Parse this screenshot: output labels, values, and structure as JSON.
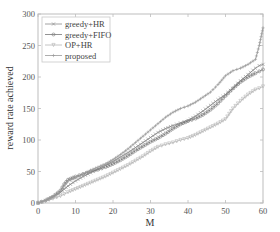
{
  "chart_data": {
    "type": "line",
    "title": "",
    "xlabel": "M",
    "ylabel": "reward rate achieved",
    "xlim": [
      0,
      60
    ],
    "ylim": [
      0,
      300
    ],
    "xticks": [
      0,
      10,
      20,
      30,
      40,
      50,
      60
    ],
    "yticks": [
      0,
      50,
      100,
      150,
      200,
      250,
      300
    ],
    "grid": false,
    "legend_position": "upper left",
    "x": [
      0,
      2,
      4,
      6,
      7,
      8,
      10,
      12,
      14,
      16,
      18,
      20,
      22,
      24,
      26,
      28,
      30,
      32,
      34,
      36,
      38,
      40,
      42,
      44,
      46,
      48,
      50,
      52,
      54,
      56,
      58,
      59,
      60
    ],
    "series": [
      {
        "name": "greedy+HR",
        "marker": "x",
        "color": "#8a8a8a",
        "values": [
          0,
          4,
          10,
          17,
          22,
          27,
          35,
          42,
          48,
          54,
          60,
          66,
          73,
          80,
          88,
          96,
          104,
          112,
          118,
          123,
          127,
          131,
          138,
          146,
          155,
          164,
          172,
          182,
          194,
          204,
          214,
          218,
          220
        ]
      },
      {
        "name": "greedy+FIFO",
        "marker": "o",
        "color": "#777777",
        "values": [
          0,
          4,
          10,
          20,
          30,
          37,
          42,
          46,
          50,
          53,
          57,
          62,
          68,
          75,
          83,
          90,
          97,
          103,
          110,
          118,
          125,
          130,
          134,
          140,
          148,
          158,
          170,
          182,
          192,
          200,
          206,
          209,
          212
        ]
      },
      {
        "name": "OP+HR",
        "marker": "v",
        "color": "#b5b5b5",
        "values": [
          0,
          3,
          7,
          11,
          14,
          17,
          22,
          27,
          32,
          37,
          42,
          48,
          54,
          60,
          67,
          74,
          82,
          89,
          93,
          96,
          100,
          103,
          108,
          114,
          120,
          126,
          133,
          150,
          162,
          172,
          180,
          182,
          185
        ]
      },
      {
        "name": "proposed",
        "marker": "+",
        "color": "#999999",
        "values": [
          0,
          4,
          10,
          18,
          28,
          35,
          40,
          46,
          52,
          57,
          62,
          69,
          77,
          86,
          96,
          106,
          116,
          126,
          136,
          144,
          150,
          154,
          160,
          168,
          176,
          188,
          202,
          210,
          214,
          220,
          228,
          250,
          278
        ]
      }
    ]
  }
}
